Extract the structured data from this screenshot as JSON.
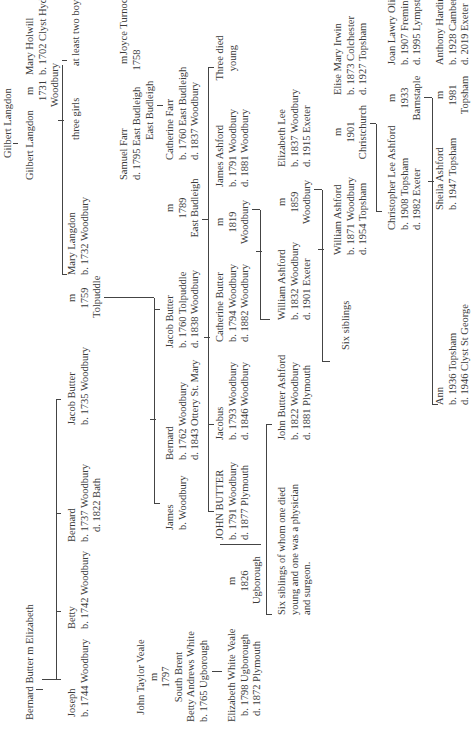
{
  "tree": {
    "gen0": {
      "gilbert_langdon_sr": "Gilbert Langdon",
      "gilbert_langdon_jr": "Gilbert Langdon",
      "marriage_langdon_holwill": {
        "m": "m",
        "year": "1731",
        "place": "Woodbury"
      },
      "mary_holwill": {
        "name": "Mary Holwill",
        "born": "b. 1702 Clyst Hydon"
      },
      "three_girls": "three girls",
      "at_least_two_boys": "at least two boys",
      "bernard_butter_sr": "Bernard Butter  m  Elizabeth"
    },
    "gen1": {
      "joseph": {
        "name": "Joseph",
        "born": "b. 1744 Woodbury"
      },
      "betty": {
        "name": "Betty",
        "born": "b. 1742 Woodbury"
      },
      "bernard": {
        "name": "Bernard",
        "born": "b. 1737 Woodbury",
        "died": "d. 1822  Bath"
      },
      "jacob_butter": {
        "name": "Jacob Butter",
        "born": "b. 1735 Woodbury"
      },
      "marriage_butter_langdon": {
        "m": "m",
        "year": "1759",
        "place": "Tolpuddle"
      },
      "mary_langdon": {
        "name": "Mary Langdon",
        "born": "b. 1732 Woodbury"
      }
    },
    "gen2": {
      "samuel_farr": {
        "name": "Samuel Farr",
        "died": "d. 1795 East Budleigh"
      },
      "marriage_farr_turnock": {
        "m": "m",
        "year": "1758",
        "place": "East Budleigh"
      },
      "joyce_turnock": "Joyce Turnock",
      "catherine_farr": {
        "name": "Catherine Farr",
        "born": "b. 1760 East Budleigh",
        "died": "d. 1837 Woodbury"
      },
      "james": {
        "name": "James",
        "born": "b. Woodbury"
      },
      "bernard_jr": {
        "name": "Bernard",
        "born": "b. 1762 Woodbury",
        "died": "d. 1843 Ottery St. Mary"
      },
      "jacob_butter_jr": {
        "name": "Jacob Butter",
        "born": "b. 1760 Tolpuddle",
        "died": "d. 1838 Woodbury"
      },
      "marriage_butter_farr": {
        "m": "m",
        "year": "1789",
        "place": "East Budleigh"
      }
    },
    "gen3": {
      "john_taylor_veale": "John Taylor Veale",
      "marriage_veale_white": {
        "m": "m",
        "year": "1797",
        "place": "South Brent"
      },
      "betty_andrews_white": {
        "name": "Betty Andrews White",
        "born": "b. 1765 Ugborough"
      },
      "elizabeth_white_veale": {
        "name": "Elizabeth White Veale",
        "born": "b. 1798 Ugborough",
        "died": "d. 1872 Plymouth"
      },
      "marriage_veale_butter": {
        "m": "m",
        "year": "1826",
        "place": "Ugborough"
      },
      "john_butter": {
        "name": "JOHN BUTTER",
        "born": "b. 1791 Woodbury",
        "died": "d. 1877 Plymouth"
      },
      "jacobus": {
        "name": "Jacobus",
        "born": "b. 1793 Woodbury",
        "died": "d. 1846 Woodbury"
      },
      "catherine_butter": {
        "name": "Catherine Butter",
        "born": "b. 1794 Woodbury",
        "died": "d. 1882 Woodbury"
      },
      "marriage_butter_ashford": {
        "m": "m",
        "year": "1819",
        "place": "Woodbury"
      },
      "james_ashford": {
        "name": "James Ashford",
        "born": "b. 1791 Woodbury",
        "died": "d. 1881 Woodbury"
      },
      "three_died_young": {
        "line1": "Three died",
        "line2": "young"
      }
    },
    "gen4": {
      "six_siblings_note": {
        "line1": "Six siblings of whom one died",
        "line2": "young and one was a physician",
        "line3": "and surgeon."
      },
      "john_butter_ashford": {
        "name": "John Butter Ashford",
        "born": "b. 1822 Woodbury",
        "died": "d. 1881 Plymouth"
      },
      "william_ashford_sr": {
        "name": "William Ashford",
        "born": "b. 1832 Woodbury",
        "died": "d. 1901 Exeter"
      },
      "marriage_ashford_lee": {
        "m": "m",
        "year": "1859",
        "place": "Woodbury"
      },
      "elizabeth_lee": {
        "name": "Elizabeth Lee",
        "born": "b. 1837 Woodbury",
        "died": "d. 1915 Exeter"
      }
    },
    "gen5": {
      "six_siblings": "Six siblings",
      "william_ashford_jr": {
        "name": "William Ashford",
        "born": "b. 1871 Woodbury",
        "died": "d. 1954 Topsham"
      },
      "marriage_ashford_irwin": {
        "m": "m",
        "year": "1901",
        "place": "Christchurch"
      },
      "elise_mary_irwin": {
        "name": "Elise Mary Irwin",
        "born": "b. 1873 Colchester",
        "died": "d. 1927 Topsham"
      }
    },
    "gen6": {
      "christopher_lee_ashford": {
        "name": "Christopher Lee Ashford",
        "born": "b. 1908 Topsham",
        "died": "d. 1982 Exeter"
      },
      "marriage_ashford_oliver": {
        "m": "m",
        "year": "1933",
        "place": "Barnstaple"
      },
      "joan_lawry_oliver": {
        "name": "Joan Lawry Oliver",
        "born": "b. 1907 Fremington",
        "died": "d. 1995 Lympstone"
      }
    },
    "gen7": {
      "ann": {
        "name": "Ann",
        "born": "b. 1936 Topsham",
        "died": "d. 1946 Clyst St George"
      },
      "sheila_ashford": {
        "name": "Sheila Ashford",
        "born": "b. 1947 Topsham"
      },
      "marriage_ashford_harding": {
        "m": "m",
        "year": "1981",
        "place": "Topsham"
      },
      "anthony_harding": {
        "name": "Anthony Harding",
        "born": "b. 1928 Camberwell",
        "died": "d. 2019 Exeter"
      }
    }
  }
}
